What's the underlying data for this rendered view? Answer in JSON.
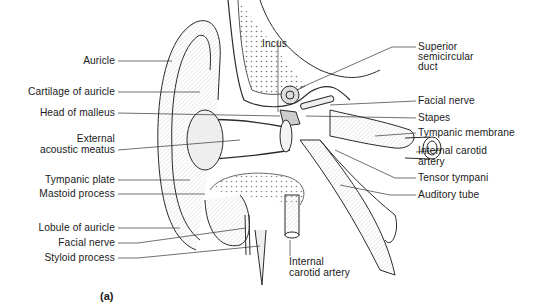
{
  "figure": {
    "caption": "(a)",
    "labels_left": [
      {
        "id": "auricle",
        "text": "Auricle"
      },
      {
        "id": "cartilage-of-auricle",
        "text": "Cartilage of auricle"
      },
      {
        "id": "head-of-malleus",
        "text": "Head of malleus"
      },
      {
        "id": "external-acoustic-meatus-1",
        "text": "External"
      },
      {
        "id": "external-acoustic-meatus-2",
        "text": "acoustic meatus"
      },
      {
        "id": "tympanic-plate",
        "text": "Tympanic plate"
      },
      {
        "id": "mastoid-process",
        "text": "Mastoid process"
      },
      {
        "id": "lobule-of-auricle",
        "text": "Lobule of auricle"
      },
      {
        "id": "facial-nerve-left",
        "text": "Facial nerve"
      },
      {
        "id": "styloid-process",
        "text": "Styloid process"
      }
    ],
    "labels_top": [
      {
        "id": "incus",
        "text": "Incus"
      }
    ],
    "labels_right": [
      {
        "id": "superior-semicircular-duct-1",
        "text": "Superior"
      },
      {
        "id": "superior-semicircular-duct-2",
        "text": "semicircular"
      },
      {
        "id": "superior-semicircular-duct-3",
        "text": "duct"
      },
      {
        "id": "facial-nerve-right",
        "text": "Facial nerve"
      },
      {
        "id": "stapes",
        "text": "Stapes"
      },
      {
        "id": "tympanic-membrane",
        "text": "Tympanic membrane"
      },
      {
        "id": "internal-carotid-artery-right-1",
        "text": "Internal carotid"
      },
      {
        "id": "internal-carotid-artery-right-2",
        "text": "artery"
      },
      {
        "id": "tensor-tympani",
        "text": "Tensor tympani"
      },
      {
        "id": "auditory-tube",
        "text": "Auditory tube"
      }
    ],
    "labels_bottom": [
      {
        "id": "internal-carotid-artery-bottom-1",
        "text": "Internal"
      },
      {
        "id": "internal-carotid-artery-bottom-2",
        "text": "carotid artery"
      }
    ],
    "colors": {
      "line": "#2a2a2a",
      "shade": "#d9d9d9",
      "background": "#ffffff"
    }
  }
}
